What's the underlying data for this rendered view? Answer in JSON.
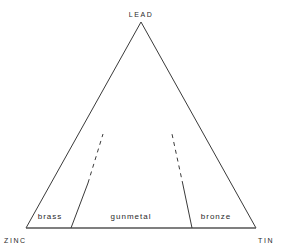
{
  "diagram": {
    "type": "ternary",
    "vertices": {
      "top": "LEAD",
      "bottom_left": "ZINC",
      "bottom_right": "TIN"
    },
    "regions": [
      {
        "label": "brass"
      },
      {
        "label": "gunmetal"
      },
      {
        "label": "bronze"
      }
    ],
    "colors": {
      "line": "#3a3a3a",
      "text": "#2a2a2a",
      "background": "#ffffff"
    }
  }
}
